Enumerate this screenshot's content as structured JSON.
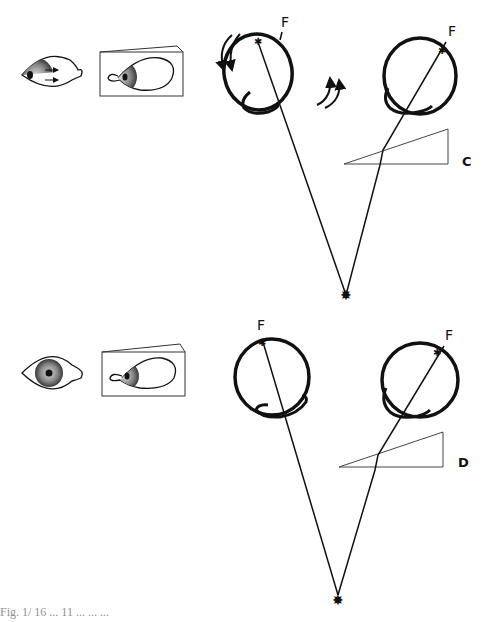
{
  "figure": {
    "caption_fragment": "Fig. 1/ 16 ... 11 ... ... ...",
    "panels": [
      {
        "id": "C",
        "label": "C",
        "left_eye_fixation_label": "F",
        "right_eye_fixation_label": "F",
        "features": [
          "front-view eye looking left with rightward arrows",
          "side view of eye behind prism",
          "left eye with torsional rotation arrows",
          "right eye viewing through base-out prism",
          "visual axes converging at fixation target"
        ]
      },
      {
        "id": "D",
        "label": "D",
        "left_eye_fixation_label": "F",
        "right_eye_fixation_label": "F",
        "features": [
          "front-view eye centered",
          "side view of eye behind prism",
          "left eye fixating",
          "right eye viewing through prism",
          "visual axes converging at fixation target"
        ]
      }
    ]
  }
}
